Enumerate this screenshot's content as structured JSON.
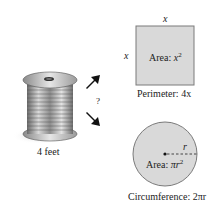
{
  "spool": {
    "label": "4 feet"
  },
  "question_mark": "?",
  "square": {
    "side_top": "x",
    "side_left": "x",
    "area_prefix": "Area: ",
    "area_var": "x",
    "area_exp": "2",
    "perimeter_prefix": "Perimeter: ",
    "perimeter_value": "4x",
    "fill": "#d9d9d9",
    "stroke": "#7a7a7a"
  },
  "circle": {
    "radius_label": "r",
    "area_prefix": "Area: ",
    "area_var": "πr",
    "area_exp": "2",
    "circumference_prefix": "Circumference: ",
    "circumference_value": "2πr",
    "fill": "#d9d9d9",
    "stroke": "#7a7a7a"
  }
}
